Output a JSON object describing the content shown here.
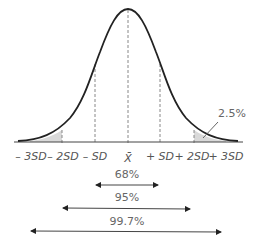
{
  "diagram": {
    "type": "normal-distribution",
    "tick_labels": [
      "– 3SD",
      "– 2SD",
      "– SD",
      "X̄",
      "+ SD",
      "+ 2SD",
      "+ 3SD"
    ],
    "tail_label": "2.5%",
    "ranges": [
      {
        "label": "68%",
        "span": "±1SD"
      },
      {
        "label": "95%",
        "span": "±2SD"
      },
      {
        "label": "99.7%",
        "span": "±3SD"
      }
    ],
    "colors": {
      "curve": "#222222",
      "shade": "#d9d9d9",
      "axis": "#444444",
      "dash": "#888888"
    }
  }
}
